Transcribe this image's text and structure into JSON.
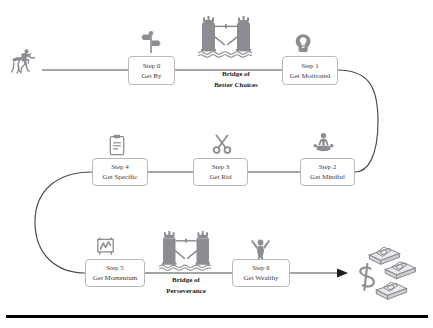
{
  "diagram": {
    "background_color": "#ffffff",
    "line_color": "#4d4d52",
    "box_border_color": "#b9b9bd",
    "icon_color": "#8c8c92",
    "text_color": "#3b3b3f",
    "label_color": "#231f20",
    "rule_color": "#000000"
  },
  "steps": [
    {
      "num": "Step 0",
      "label": "Get By",
      "icon": "signpost-icon"
    },
    {
      "num": "Step 1",
      "label": "Get Motivated",
      "icon": "head-lightbulb-icon"
    },
    {
      "num": "Step 2",
      "label": "Get Mindful",
      "icon": "meditation-icon"
    },
    {
      "num": "Step 3",
      "label": "Get Rid",
      "icon": "scissors-icon"
    },
    {
      "num": "Step 4",
      "label": "Get Specific",
      "icon": "clipboard-icon"
    },
    {
      "num": "Step 5",
      "label": "Get Momentum",
      "icon": "bar-chart-icon"
    },
    {
      "num": "Step 6",
      "label": "Get Wealthy",
      "icon": "celebrating-person-icon"
    }
  ],
  "bridges": [
    {
      "line1": "Bridge of",
      "line2": "Better Choices",
      "icon": "tower-bridge-icon"
    },
    {
      "line1": "Bridge of",
      "line2": "Perseverance",
      "icon": "tower-bridge-icon"
    }
  ],
  "endpoints": {
    "start": {
      "icon": "horse-rider-icon"
    },
    "finish": {
      "icon": "money-stacks-icon"
    }
  }
}
